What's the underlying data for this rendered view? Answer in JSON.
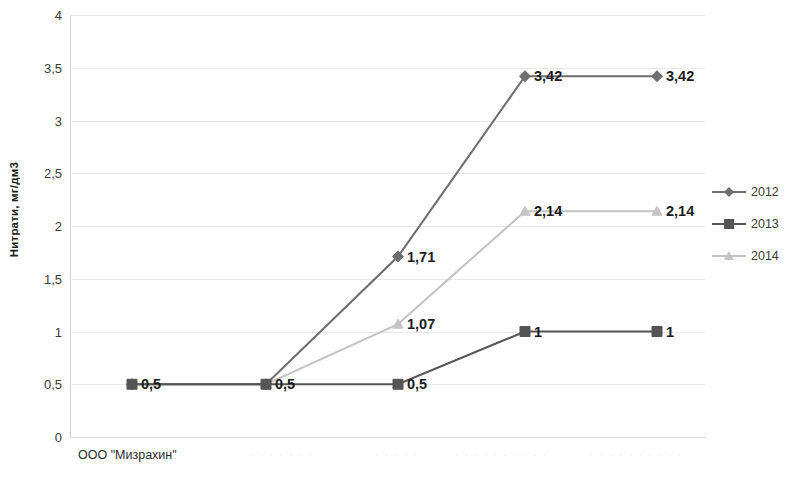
{
  "chart_data": {
    "type": "line",
    "title": "",
    "xlabel": "",
    "ylabel": "Нитрати, мг/дм3",
    "ylim": [
      0,
      4
    ],
    "y_ticks": [
      0,
      0.5,
      1,
      1.5,
      2,
      2.5,
      3,
      3.5,
      4
    ],
    "y_tick_labels": [
      "0",
      "0,5",
      "1",
      "1,5",
      "2",
      "2,5",
      "3",
      "3,5",
      "4"
    ],
    "grid": true,
    "legend_position": "right",
    "x_count": 5,
    "x_caption": "ООО \"Мизрахин\"",
    "series": [
      {
        "name": "2012",
        "marker": "diamond",
        "color": "#6e6e6e",
        "values": [
          0.5,
          0.5,
          1.71,
          3.42,
          3.42
        ],
        "labels": [
          "0,5",
          "0,5",
          "1,71",
          "3,42",
          "3,42"
        ],
        "labels_shown": [
          false,
          false,
          true,
          true,
          true
        ]
      },
      {
        "name": "2013",
        "marker": "square",
        "color": "#555555",
        "values": [
          0.5,
          0.5,
          0.5,
          1,
          1
        ],
        "labels": [
          "0,5",
          "0,5",
          "0,5",
          "1",
          "1"
        ],
        "labels_shown": [
          true,
          true,
          true,
          true,
          true
        ]
      },
      {
        "name": "2014",
        "marker": "triangle",
        "color": "#c4c4c4",
        "values": [
          0.5,
          0.5,
          1.07,
          2.14,
          2.14
        ],
        "labels": [
          "0,5",
          "0,5",
          "1,07",
          "2,14",
          "2,14"
        ],
        "labels_shown": [
          false,
          false,
          true,
          true,
          true
        ]
      }
    ]
  },
  "legend": {
    "items": [
      {
        "label": "2012"
      },
      {
        "label": "2013"
      },
      {
        "label": "2014"
      }
    ]
  },
  "axes": {
    "y_title": "Нитрати, мг/дм3",
    "x_caption": "ООО \"Мизрахин\""
  },
  "colors": {
    "series_2012": "#6e6e6e",
    "series_2013": "#555555",
    "series_2014": "#c4c4c4",
    "gridline": "#e8e8e8",
    "label_text": "#1b1b1b",
    "tick_text": "#3c3c3c"
  }
}
